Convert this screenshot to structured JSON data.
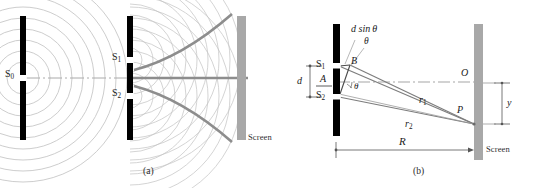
{
  "figure": {
    "panels": [
      {
        "id": "a",
        "caption": "(a)",
        "labels": {
          "source_slit": "S",
          "source_slit_sub": "0",
          "slit1": "S",
          "slit1_sub": "1",
          "slit2": "S",
          "slit2_sub": "2",
          "screen": "Screen"
        }
      },
      {
        "id": "b",
        "caption": "(b)",
        "labels": {
          "path_difference": "d sin",
          "theta": "θ",
          "theta_at_slit": "θ",
          "theta_at_axis": "θ",
          "slit1": "S",
          "slit1_sub": "1",
          "slit2": "S",
          "slit2_sub": "2",
          "midpoint": "A",
          "foot_point": "B",
          "slit_separation": "d",
          "ray1": "r",
          "ray1_sub": "1",
          "ray2": "r",
          "ray2_sub": "2",
          "center_point": "O",
          "bright_point": "P",
          "fringe_position": "y",
          "screen_distance": "R",
          "screen": "Screen"
        }
      }
    ],
    "colors": {
      "barrier": "#000000",
      "screen": "#a8a8a8",
      "wavefront": "#b9b9b9",
      "nodal_line": "#8d8d8d",
      "axis": "#9a9a9a",
      "ray": "#7d7d7d",
      "dimension": "#555555",
      "text": "#1a1a1a",
      "background": "#ffffff"
    }
  }
}
